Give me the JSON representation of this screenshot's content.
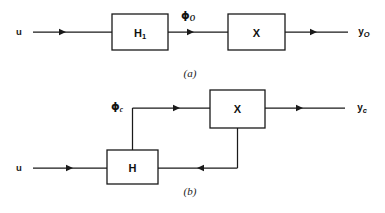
{
  "figure": {
    "background_color": "#ffffff",
    "line_color": "#1a1a1a",
    "panels": [
      {
        "id": "panel-a",
        "caption": "(a)",
        "kind": "open-loop",
        "input_label": "u",
        "output_label": "y",
        "output_subscript": "O",
        "intermediate_label": "ϕ",
        "intermediate_subscript": "O",
        "blocks": [
          {
            "id": "block-h1",
            "label": "H",
            "subscript": "1"
          },
          {
            "id": "block-x-open",
            "label": "X",
            "subscript": ""
          }
        ]
      },
      {
        "id": "panel-b",
        "caption": "(b)",
        "kind": "closed-loop",
        "input_label": "u",
        "output_label": "y",
        "output_subscript": "c",
        "intermediate_label": "ϕ",
        "intermediate_subscript": "c",
        "blocks": [
          {
            "id": "block-h",
            "label": "H",
            "subscript": ""
          },
          {
            "id": "block-x-closed",
            "label": "X",
            "subscript": ""
          }
        ]
      }
    ]
  },
  "panel_a": {
    "input_label": "u",
    "block_h1_label": "H",
    "block_h1_sub": "1",
    "phi_label": "ϕ",
    "phi_sub": "O",
    "block_x_label": "X",
    "output_label": "y",
    "output_sub": "O",
    "caption": "(a)"
  },
  "panel_b": {
    "input_label": "u",
    "block_h_label": "H",
    "phi_label": "ϕ",
    "phi_sub": "c",
    "block_x_label": "X",
    "output_label": "y",
    "output_sub": "c",
    "caption": "(b)"
  }
}
